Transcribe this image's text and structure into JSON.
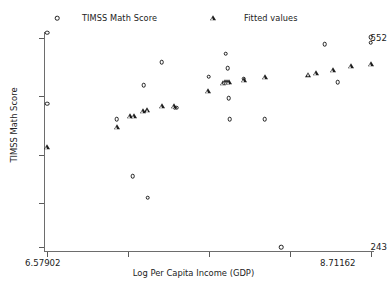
{
  "chart_data": {
    "type": "scatter",
    "title": "",
    "xlabel": "Log Per Capita Income (GDP)",
    "ylabel": "TIMSS Math Score",
    "xlim": [
      6.57902,
      8.71162
    ],
    "ylim": [
      243,
      552
    ],
    "xticklabels": [
      "6.57902",
      "8.71162"
    ],
    "yticklabels": [
      "552",
      "243"
    ],
    "grid": false,
    "legend_position": "top",
    "series": [
      {
        "name": "TIMSS Math Score",
        "marker": "circle",
        "color": "#1c1c1c",
        "points": [
          {
            "x": 6.579,
            "y": 455
          },
          {
            "x": 6.579,
            "y": 560
          },
          {
            "x": 7.038,
            "y": 432
          },
          {
            "x": 7.143,
            "y": 348
          },
          {
            "x": 7.215,
            "y": 482
          },
          {
            "x": 7.242,
            "y": 316
          },
          {
            "x": 7.334,
            "y": 516
          },
          {
            "x": 7.419,
            "y": 449
          },
          {
            "x": 7.432,
            "y": 449
          },
          {
            "x": 7.643,
            "y": 495
          },
          {
            "x": 7.755,
            "y": 529
          },
          {
            "x": 7.768,
            "y": 507
          },
          {
            "x": 7.775,
            "y": 463
          },
          {
            "x": 7.781,
            "y": 432
          },
          {
            "x": 7.874,
            "y": 492
          },
          {
            "x": 8.012,
            "y": 432
          },
          {
            "x": 8.122,
            "y": 243
          },
          {
            "x": 8.406,
            "y": 543
          },
          {
            "x": 8.492,
            "y": 487
          },
          {
            "x": 8.709,
            "y": 553
          },
          {
            "x": 8.709,
            "y": 545
          }
        ]
      },
      {
        "name": "Fitted values",
        "marker": "triangle",
        "color": "#1c1c1c",
        "points": [
          {
            "x": 6.579,
            "y": 391
          },
          {
            "x": 7.038,
            "y": 420
          },
          {
            "x": 7.124,
            "y": 437
          },
          {
            "x": 7.15,
            "y": 437
          },
          {
            "x": 7.212,
            "y": 444
          },
          {
            "x": 7.24,
            "y": 446
          },
          {
            "x": 7.334,
            "y": 452
          },
          {
            "x": 7.413,
            "y": 452
          },
          {
            "x": 7.641,
            "y": 473
          },
          {
            "x": 7.74,
            "y": 485
          },
          {
            "x": 7.752,
            "y": 487
          },
          {
            "x": 7.762,
            "y": 487
          },
          {
            "x": 7.775,
            "y": 487
          },
          {
            "x": 7.874,
            "y": 490
          },
          {
            "x": 8.011,
            "y": 494
          },
          {
            "x": 8.3,
            "y": 498
          },
          {
            "x": 8.352,
            "y": 500
          },
          {
            "x": 8.463,
            "y": 504
          },
          {
            "x": 8.582,
            "y": 510
          },
          {
            "x": 8.709,
            "y": 513
          }
        ]
      }
    ]
  },
  "legend": {
    "entries": [
      {
        "label": "TIMSS Math Score",
        "marker": "circle-marker-icon"
      },
      {
        "label": "Fitted values",
        "marker": "triangle-marker-icon"
      }
    ]
  },
  "axes": {
    "y_top_label": "552",
    "y_bottom_label": "243",
    "x_left_label": "6.57902",
    "x_right_label": "8.71162",
    "x_title": "Log Per Capita Income (GDP)",
    "y_title": "TIMSS Math Score"
  },
  "colors": {
    "marker": "#1c1c1c",
    "axis": "#6d6d6d",
    "text": "#222222",
    "background": "#ffffff"
  }
}
